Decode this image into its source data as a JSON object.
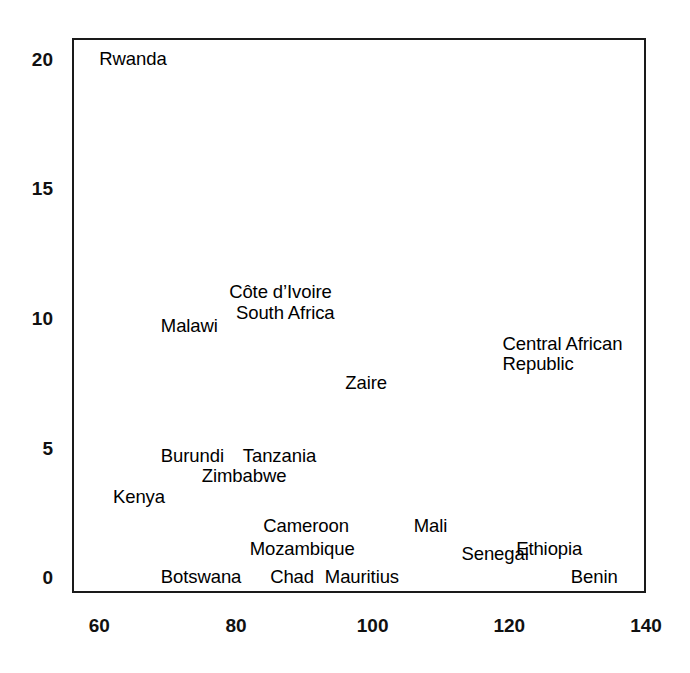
{
  "chart_data": {
    "type": "scatter",
    "title": "",
    "subtitle": "",
    "xlabel": "",
    "ylabel": "",
    "xlim": [
      56,
      140
    ],
    "ylim": [
      -0.6,
      20.8
    ],
    "grid": false,
    "legend": null,
    "marker_style": "text-label-only",
    "xticks": [
      60,
      80,
      100,
      120,
      140
    ],
    "yticks": [
      0,
      5,
      10,
      15,
      20
    ],
    "xtick_labels": [
      "60",
      "80",
      "100",
      "120",
      "140"
    ],
    "ytick_labels": [
      "0",
      "5",
      "10",
      "15",
      "20"
    ],
    "points": [
      {
        "label": "Rwanda",
        "x": 60.0,
        "y": 20.0
      },
      {
        "label": "Côte d’Ivoire",
        "x": 79.0,
        "y": 11.0
      },
      {
        "label": "South Africa",
        "x": 80.0,
        "y": 10.2
      },
      {
        "label": "Malawi",
        "x": 69.0,
        "y": 9.7
      },
      {
        "label": "Central African Republic",
        "x": 119.0,
        "y": 8.6
      },
      {
        "label": "Zaire",
        "x": 96.0,
        "y": 7.5
      },
      {
        "label": "Burundi",
        "x": 69.0,
        "y": 4.7
      },
      {
        "label": "Tanzania",
        "x": 81.0,
        "y": 4.7
      },
      {
        "label": "Zimbabwe",
        "x": 75.0,
        "y": 3.9
      },
      {
        "label": "Kenya",
        "x": 62.0,
        "y": 3.1
      },
      {
        "label": "Cameroon",
        "x": 84.0,
        "y": 2.0
      },
      {
        "label": "Mali",
        "x": 106.0,
        "y": 2.0
      },
      {
        "label": "Mozambique",
        "x": 82.0,
        "y": 1.1
      },
      {
        "label": "Senegal",
        "x": 113.0,
        "y": 0.9
      },
      {
        "label": "Ethiopia",
        "x": 121.0,
        "y": 1.1
      },
      {
        "label": "Botswana",
        "x": 69.0,
        "y": 0.0
      },
      {
        "label": "Chad",
        "x": 85.0,
        "y": 0.0
      },
      {
        "label": "Mauritius",
        "x": 93.0,
        "y": 0.0
      },
      {
        "label": "Benin",
        "x": 129.0,
        "y": 0.0
      }
    ]
  },
  "colors": {
    "axis": "#1a1a1a",
    "text": "#000000",
    "background": "#ffffff"
  }
}
